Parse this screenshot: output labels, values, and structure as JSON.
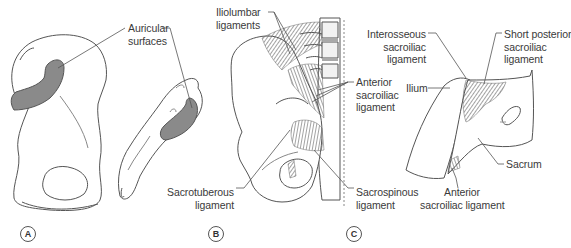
{
  "figure": {
    "panels": [
      {
        "id": "A",
        "tag": "A",
        "labels": {
          "auricular_surfaces": "Auricular\nsurfaces"
        }
      },
      {
        "id": "B",
        "tag": "B",
        "labels": {
          "iliolumbar_ligaments": "Iliolumbar\nligaments",
          "anterior_sacroiliac_ligament": "Anterior\nsacroiliac\nligament",
          "sacrotuberous_ligament": "Sacrotuberous\nligament",
          "sacrospinous_ligament": "Sacrospinous\nligament"
        }
      },
      {
        "id": "C",
        "tag": "C",
        "labels": {
          "interosseous_sacroiliac_ligament": "Interosseous\nsacroiliac\nligament",
          "short_posterior_sacroiliac_ligament": "Short posterior\nsacroiliac\nligament",
          "ilium": "Ilium",
          "sacrum": "Sacrum",
          "anterior_sacroiliac_ligament": "Anterior\nsacroiliac ligament"
        }
      }
    ],
    "colors": {
      "line": "#555555",
      "articular_fill": "#8a8a8a",
      "ligament": "#6a6a6a",
      "background": "#ffffff"
    }
  }
}
